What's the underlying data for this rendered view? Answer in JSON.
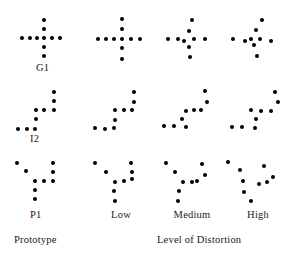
{
  "figure": {
    "title": "",
    "dot_color": "#000000",
    "background": "#ffffff",
    "row_labels": [
      "G1",
      "I2",
      "P1"
    ],
    "column_labels": [
      "Low",
      "Medium",
      "High"
    ],
    "axis_labels": {
      "prototype": "Prototype",
      "distortion": "Level of Distortion"
    },
    "columns": [
      "Prototype",
      "Low",
      "Medium",
      "High"
    ],
    "patterns": [
      {
        "row": "G1",
        "column": "Prototype",
        "dots": [
          [
            36,
            6
          ],
          [
            36,
            15
          ],
          [
            36,
            24
          ],
          [
            36,
            33
          ],
          [
            36,
            42
          ],
          [
            14,
            24
          ],
          [
            22,
            24
          ],
          [
            29,
            24
          ],
          [
            44,
            24
          ],
          [
            52,
            24
          ]
        ]
      },
      {
        "row": "G1",
        "column": "Low",
        "dots": [
          [
            36,
            5
          ],
          [
            36,
            15
          ],
          [
            36,
            25
          ],
          [
            36,
            34
          ],
          [
            36,
            45
          ],
          [
            12,
            25
          ],
          [
            20,
            25
          ],
          [
            28,
            25
          ],
          [
            45,
            25
          ],
          [
            54,
            25
          ]
        ]
      },
      {
        "row": "G1",
        "column": "Medium",
        "dots": [
          [
            36,
            6
          ],
          [
            33,
            17
          ],
          [
            38,
            25
          ],
          [
            33,
            33
          ],
          [
            34,
            43
          ],
          [
            12,
            25
          ],
          [
            22,
            25
          ],
          [
            28,
            27
          ],
          [
            49,
            25
          ]
        ]
      },
      {
        "row": "G1",
        "column": "High",
        "dots": [
          [
            38,
            6
          ],
          [
            32,
            16
          ],
          [
            36,
            25
          ],
          [
            30,
            31
          ],
          [
            33,
            42
          ],
          [
            9,
            25
          ],
          [
            21,
            27
          ],
          [
            27,
            25
          ],
          [
            47,
            27
          ]
        ]
      },
      {
        "row": "I2",
        "column": "Prototype",
        "dots": [
          [
            46,
            4
          ],
          [
            46,
            13
          ],
          [
            46,
            22
          ],
          [
            28,
            22
          ],
          [
            36,
            22
          ],
          [
            28,
            31
          ],
          [
            10,
            41
          ],
          [
            19,
            41
          ],
          [
            27,
            41
          ]
        ]
      },
      {
        "row": "I2",
        "column": "Low",
        "dots": [
          [
            48,
            4
          ],
          [
            48,
            14
          ],
          [
            46,
            22
          ],
          [
            29,
            22
          ],
          [
            38,
            22
          ],
          [
            29,
            32
          ],
          [
            9,
            40
          ],
          [
            19,
            41
          ],
          [
            28,
            40
          ]
        ]
      },
      {
        "row": "I2",
        "column": "Medium",
        "dots": [
          [
            49,
            3
          ],
          [
            51,
            14
          ],
          [
            45,
            22
          ],
          [
            30,
            23
          ],
          [
            38,
            22
          ],
          [
            26,
            31
          ],
          [
            8,
            38
          ],
          [
            18,
            38
          ],
          [
            30,
            39
          ]
        ]
      },
      {
        "row": "I2",
        "column": "High",
        "dots": [
          [
            51,
            4
          ],
          [
            54,
            14
          ],
          [
            47,
            23
          ],
          [
            27,
            22
          ],
          [
            37,
            23
          ],
          [
            32,
            31
          ],
          [
            8,
            39
          ],
          [
            18,
            39
          ],
          [
            31,
            40
          ]
        ]
      },
      {
        "row": "P1",
        "column": "Prototype",
        "dots": [
          [
            9,
            5
          ],
          [
            18,
            13
          ],
          [
            45,
            5
          ],
          [
            45,
            14
          ],
          [
            27,
            23
          ],
          [
            36,
            23
          ],
          [
            45,
            23
          ],
          [
            27,
            32
          ],
          [
            27,
            41
          ]
        ]
      },
      {
        "row": "P1",
        "column": "Low",
        "dots": [
          [
            9,
            5
          ],
          [
            20,
            14
          ],
          [
            45,
            5
          ],
          [
            46,
            14
          ],
          [
            29,
            24
          ],
          [
            38,
            23
          ],
          [
            46,
            21
          ],
          [
            28,
            33
          ],
          [
            29,
            43
          ]
        ]
      },
      {
        "row": "P1",
        "column": "Medium",
        "dots": [
          [
            10,
            5
          ],
          [
            19,
            14
          ],
          [
            46,
            6
          ],
          [
            49,
            17
          ],
          [
            27,
            24
          ],
          [
            36,
            24
          ],
          [
            41,
            23
          ],
          [
            23,
            33
          ],
          [
            22,
            43
          ]
        ]
      },
      {
        "row": "P1",
        "column": "High",
        "dots": [
          [
            4,
            4
          ],
          [
            16,
            12
          ],
          [
            40,
            8
          ],
          [
            49,
            19
          ],
          [
            19,
            23
          ],
          [
            35,
            26
          ],
          [
            43,
            24
          ],
          [
            20,
            34
          ],
          [
            27,
            43
          ]
        ]
      }
    ]
  }
}
